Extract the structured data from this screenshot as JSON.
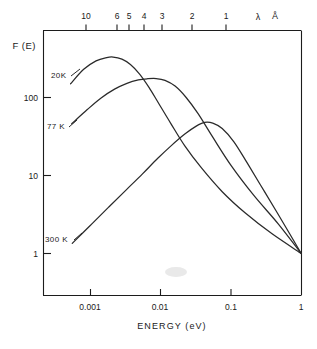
{
  "figure": {
    "background_color": "#ffffff",
    "line_color": "#2a2a2a"
  },
  "axes": {
    "y": {
      "label": "F (E)",
      "scale": "log",
      "ticks": [
        "100",
        "10",
        "1"
      ],
      "range_min": 0.5,
      "range_max": 700
    },
    "x_bottom": {
      "label": "ENERGY (eV)",
      "scale": "log",
      "ticks": [
        "0.001",
        "0.01",
        "0.1",
        "1"
      ],
      "range_min": 0.0004,
      "range_max": 1.0
    },
    "x_top": {
      "label_lambda": "λ",
      "label_unit": "Å",
      "ticks": [
        "10",
        "6",
        "5",
        "4",
        "3",
        "2",
        "1"
      ]
    }
  },
  "chart_data": {
    "type": "line",
    "title": "",
    "xlabel": "ENERGY (eV)",
    "ylabel": "F (E)",
    "xscale": "log",
    "yscale": "log",
    "xlim": [
      0.0004,
      1.0
    ],
    "ylim": [
      0.5,
      700
    ],
    "grid": false,
    "legend_position": "inline-labels",
    "x_top_axis": {
      "label": "λ Å",
      "tick_labels": [
        "10",
        "6",
        "5",
        "4",
        "3",
        "2",
        "1"
      ],
      "tick_energies_eV": [
        0.0012,
        0.0034,
        0.0049,
        0.0078,
        0.0138,
        0.031,
        0.124
      ]
    },
    "series": [
      {
        "name": "20K",
        "label": "20K",
        "peak_energy_eV": 0.0021,
        "peak_value": 330,
        "x": [
          0.00052,
          0.0008,
          0.0012,
          0.0017,
          0.0021,
          0.0028,
          0.0037,
          0.005,
          0.0068,
          0.0095,
          0.014,
          0.022,
          0.038,
          0.075,
          0.16,
          0.38,
          1.0
        ],
        "y": [
          150,
          230,
          295,
          325,
          330,
          310,
          265,
          200,
          135,
          82,
          46,
          24,
          12.5,
          6.2,
          3.3,
          1.8,
          1.0
        ]
      },
      {
        "name": "77 K",
        "label": "77 K",
        "peak_energy_eV": 0.0086,
        "peak_value": 175,
        "x": [
          0.00054,
          0.0009,
          0.0014,
          0.0022,
          0.0033,
          0.0048,
          0.0065,
          0.0086,
          0.0115,
          0.016,
          0.023,
          0.034,
          0.055,
          0.1,
          0.21,
          0.47,
          1.0
        ],
        "y": [
          46,
          70,
          98,
          128,
          152,
          168,
          174,
          175,
          166,
          140,
          100,
          62,
          31,
          13.5,
          5.6,
          2.4,
          1.0
        ]
      },
      {
        "name": "300 K",
        "label": "300 K",
        "peak_energy_eV": 0.042,
        "peak_value": 48,
        "x": [
          0.00055,
          0.001,
          0.0018,
          0.0032,
          0.0055,
          0.009,
          0.014,
          0.022,
          0.032,
          0.042,
          0.055,
          0.075,
          0.11,
          0.17,
          0.3,
          0.55,
          1.0
        ],
        "y": [
          1.35,
          2.3,
          3.9,
          6.5,
          10.5,
          16.5,
          24,
          34,
          43,
          48,
          47,
          40,
          27,
          14.5,
          6.2,
          2.5,
          1.0
        ]
      }
    ]
  },
  "series_labels": [
    {
      "text": "20K"
    },
    {
      "text": "77 K"
    },
    {
      "text": "300 K"
    }
  ]
}
